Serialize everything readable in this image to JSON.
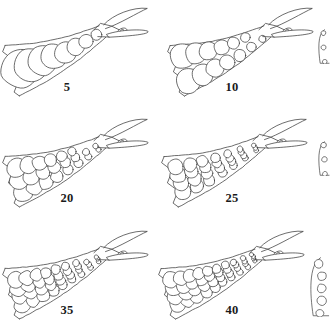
{
  "figure": {
    "kind": "scientific-line-drawing-plate",
    "columns": 3,
    "rows": 3,
    "line_color": "#3c3c3c",
    "fill_color": "#ffffff",
    "background_color": "#ffffff",
    "label_color": "#1a1a1a"
  },
  "panels": [
    {
      "id": "panel-5",
      "label": "5",
      "row": 1,
      "column": 1,
      "cell_count": 8,
      "label_x": 67,
      "label_y": 88
    },
    {
      "id": "panel-10",
      "label": "10",
      "row": 1,
      "column": 2,
      "cell_count": 13,
      "label_x": 232,
      "label_y": 88
    },
    {
      "id": "panel-20",
      "label": "20",
      "row": 2,
      "column": 1,
      "cell_count": 22,
      "label_x": 67,
      "label_y": 199
    },
    {
      "id": "panel-25",
      "label": "25",
      "row": 2,
      "column": 2,
      "cell_count": 27,
      "label_x": 232,
      "label_y": 199
    },
    {
      "id": "panel-35",
      "label": "35",
      "row": 3,
      "column": 1,
      "cell_count": 34,
      "label_x": 67,
      "label_y": 311
    },
    {
      "id": "panel-40",
      "label": "40",
      "row": 3,
      "column": 2,
      "cell_count": 40,
      "label_x": 232,
      "label_y": 311
    }
  ],
  "edge_fragments": [
    {
      "id": "fragment-row1",
      "row": 1,
      "note": "partial drawing cut off at right page edge"
    },
    {
      "id": "fragment-row2",
      "row": 2,
      "note": "partial drawing cut off at right page edge"
    },
    {
      "id": "fragment-row3",
      "row": 3,
      "note": "partial drawing cut off at right page edge"
    }
  ]
}
